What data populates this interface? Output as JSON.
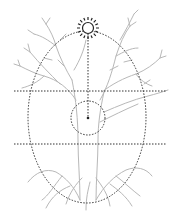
{
  "diagram": {
    "colors": {
      "tree": "#b8b8b8",
      "dotted": "#333333",
      "sun": "#222222",
      "background": "#ffffff"
    },
    "elements": {
      "sun": {
        "cx": 88,
        "cy": 28,
        "r": 6,
        "rays": 12
      },
      "ellipse": {
        "cx": 87,
        "cy": 117,
        "rx": 59,
        "ry": 86
      },
      "horizontal_lines": [
        {
          "y": 91,
          "x1": 14,
          "x2": 167
        },
        {
          "y": 144,
          "x1": 14,
          "x2": 167
        }
      ],
      "center_circle": {
        "cx": 88,
        "cy": 118,
        "r": 17
      },
      "vertical_line": {
        "x": 88,
        "y1": 34,
        "y2": 118
      }
    }
  }
}
